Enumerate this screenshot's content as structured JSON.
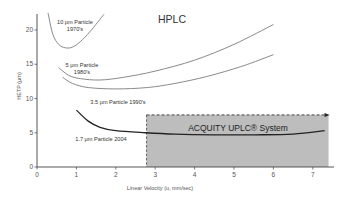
{
  "chart_data": {
    "type": "line",
    "title": "HPLC",
    "xlabel": "Linear Velocity (u, mm/sec)",
    "ylabel": "HETP (μm)",
    "xlim": [
      0,
      7.5
    ],
    "ylim": [
      0,
      22.5
    ],
    "x_ticks": [
      0,
      1,
      2,
      3,
      4,
      5,
      6,
      7
    ],
    "y_ticks": [
      0,
      5,
      10,
      15,
      20
    ],
    "grid": false,
    "legend": "none (inline labels)",
    "series": [
      {
        "name": "10 μm Particle 1970's",
        "label_lines": [
          "10 μm Particle",
          "1970's"
        ],
        "x": [
          0.28,
          0.4,
          0.55,
          0.72,
          0.9,
          1.1,
          1.35,
          1.7
        ],
        "y": [
          22.5,
          19.4,
          17.9,
          17.4,
          17.5,
          18.3,
          19.8,
          22.3
        ]
      },
      {
        "name": "5 μm Particle 1980's",
        "label_lines": [
          "5 μm Particle",
          "1980's"
        ],
        "x": [
          0.55,
          0.8,
          1.1,
          1.6,
          2.2,
          3.0,
          4.0,
          5.0,
          6.0
        ],
        "y": [
          14.5,
          13.4,
          12.9,
          12.7,
          13.1,
          14.0,
          15.6,
          17.9,
          20.8
        ]
      },
      {
        "name": "3.5 μm Particle 1990's",
        "label_lines": [
          "3.5 μm Particle 1990's"
        ],
        "x": [
          0.65,
          0.9,
          1.3,
          2.0,
          2.8,
          3.5,
          4.3,
          5.2,
          6.0
        ],
        "y": [
          13.1,
          12.2,
          11.6,
          11.4,
          11.6,
          12.2,
          13.2,
          14.7,
          16.4
        ]
      },
      {
        "name": "1.7 μm Particle 2004",
        "label_lines": [
          "1.7 μm Particle 2004"
        ],
        "x": [
          1.0,
          1.3,
          1.6,
          2.0,
          2.75,
          3.5,
          4.5,
          5.5,
          6.5,
          7.3
        ],
        "y": [
          8.3,
          6.7,
          5.8,
          5.3,
          5.0,
          4.8,
          4.7,
          4.7,
          4.8,
          5.3
        ]
      }
    ],
    "annotations": [
      {
        "type": "shaded_region",
        "label": "ACQUITY UPLC® System",
        "x_range": [
          2.78,
          7.4
        ],
        "y_range": [
          0,
          7.6
        ],
        "fill": "#bdbdbd",
        "border": "dashed"
      }
    ]
  },
  "colors": {
    "hplc_curves": "#8a8a8a",
    "uplc_curve": "#222222",
    "axis": "#444444",
    "region_fill": "#bdbdbd",
    "text": "#333333"
  }
}
